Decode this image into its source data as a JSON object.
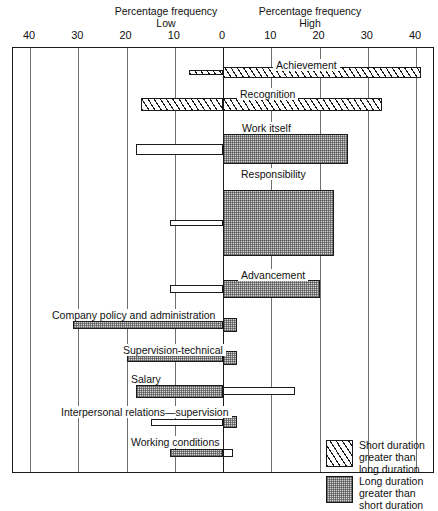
{
  "figure": {
    "left_header_line1": "Percentage frequency",
    "left_header_line2": "Low",
    "right_header_line1": "Percentage frequency",
    "right_header_line2": "High"
  },
  "axis": {
    "ticks": [
      "40",
      "30",
      "20",
      "10",
      "0",
      "10",
      "20",
      "30",
      "40"
    ],
    "left_max": 40,
    "right_max": 40,
    "zero_label": "0"
  },
  "legend": {
    "items": [
      {
        "pattern": "hatch",
        "line1": "Short duration",
        "line2": "greater than",
        "line3": "long duration"
      },
      {
        "pattern": "dots",
        "line1": "Long duration",
        "line2": "greater than",
        "line3": "short duration"
      }
    ]
  },
  "chart_data": {
    "type": "bar",
    "orientation": "horizontal-diverging",
    "xlabel": "Percentage frequency",
    "ylabel": "",
    "xlim": [
      -40,
      40
    ],
    "grid": true,
    "legend_position": "bottom-right",
    "axis_note": "Left half = Low (dissatisfaction) frequency, right half = High (satisfaction) frequency. Bar thickness encodes duration of attitude.",
    "categories": [
      "Achievement",
      "Recognition",
      "Work itself",
      "Responsibility",
      "Advancement",
      "Company policy and administration",
      "Supervision-technical",
      "Salary",
      "Interpersonal relations—supervision",
      "Working conditions"
    ],
    "series": [
      {
        "name": "Low (percentage frequency)",
        "values": [
          7,
          17,
          18,
          11,
          11,
          31,
          20,
          18,
          15,
          11
        ]
      },
      {
        "name": "High (percentage frequency)",
        "values": [
          41,
          33,
          26,
          23,
          20,
          3,
          3,
          15,
          3,
          2
        ]
      }
    ],
    "bars": [
      {
        "label": "Achievement",
        "low": 7,
        "high": 41,
        "low_pattern": "hatch",
        "high_pattern": "hatch",
        "low_thickness": 5,
        "high_thickness": 11
      },
      {
        "label": "Recognition",
        "low": 17,
        "high": 33,
        "low_pattern": "hatch",
        "high_pattern": "hatch",
        "low_thickness": 13,
        "high_thickness": 13
      },
      {
        "label": "Work itself",
        "low": 18,
        "high": 26,
        "low_pattern": "plain",
        "high_pattern": "dots",
        "low_thickness": 11,
        "high_thickness": 30
      },
      {
        "label": "Responsibility",
        "low": 11,
        "high": 23,
        "low_pattern": "plain",
        "high_pattern": "dots",
        "low_thickness": 6,
        "high_thickness": 66
      },
      {
        "label": "Advancement",
        "low": 11,
        "high": 20,
        "low_pattern": "plain",
        "high_pattern": "dots",
        "low_thickness": 8,
        "high_thickness": 18
      },
      {
        "label": "Company policy and administration",
        "low": 31,
        "high": 3,
        "low_pattern": "dots",
        "high_pattern": "dots",
        "low_thickness": 8,
        "high_thickness": 14
      },
      {
        "label": "Supervision-technical",
        "low": 20,
        "high": 3,
        "low_pattern": "dots",
        "high_pattern": "dots",
        "low_thickness": 8,
        "high_thickness": 14
      },
      {
        "label": "Salary",
        "low": 18,
        "high": 15,
        "low_pattern": "dots",
        "high_pattern": "plain",
        "low_thickness": 13,
        "high_thickness": 8
      },
      {
        "label": "Interpersonal relations—supervision",
        "low": 15,
        "high": 3,
        "low_pattern": "plain",
        "high_pattern": "dots",
        "low_thickness": 7,
        "high_thickness": 12
      },
      {
        "label": "Working conditions",
        "low": 11,
        "high": 2,
        "low_pattern": "dots",
        "high_pattern": "plain",
        "low_thickness": 8,
        "high_thickness": 8
      }
    ]
  },
  "layout": {
    "plot_left_px": 12,
    "plot_top_px": 47,
    "plot_width_px": 422,
    "plot_height_px": 426,
    "zero_x_px": 210,
    "px_per_unit": 4.825,
    "rows": [
      {
        "label_y": 58,
        "label_x": 272,
        "bar_mid_y": 71
      },
      {
        "label_y": 87,
        "label_x": 236,
        "bar_mid_y": 103
      },
      {
        "label_y": 121,
        "label_x": 238,
        "bar_mid_y": 148
      },
      {
        "label_y": 167,
        "label_x": 237,
        "bar_mid_y": 222
      },
      {
        "label_y": 268,
        "label_x": 237,
        "bar_mid_y": 288
      },
      {
        "label_y": 308,
        "label_x": 48,
        "bar_mid_y": 324
      },
      {
        "label_y": 343,
        "label_x": 119,
        "bar_mid_y": 357
      },
      {
        "label_y": 372,
        "label_x": 127,
        "bar_mid_y": 390
      },
      {
        "label_y": 405,
        "label_x": 57,
        "bar_mid_y": 421
      },
      {
        "label_y": 435,
        "label_x": 127,
        "bar_mid_y": 452
      }
    ]
  }
}
